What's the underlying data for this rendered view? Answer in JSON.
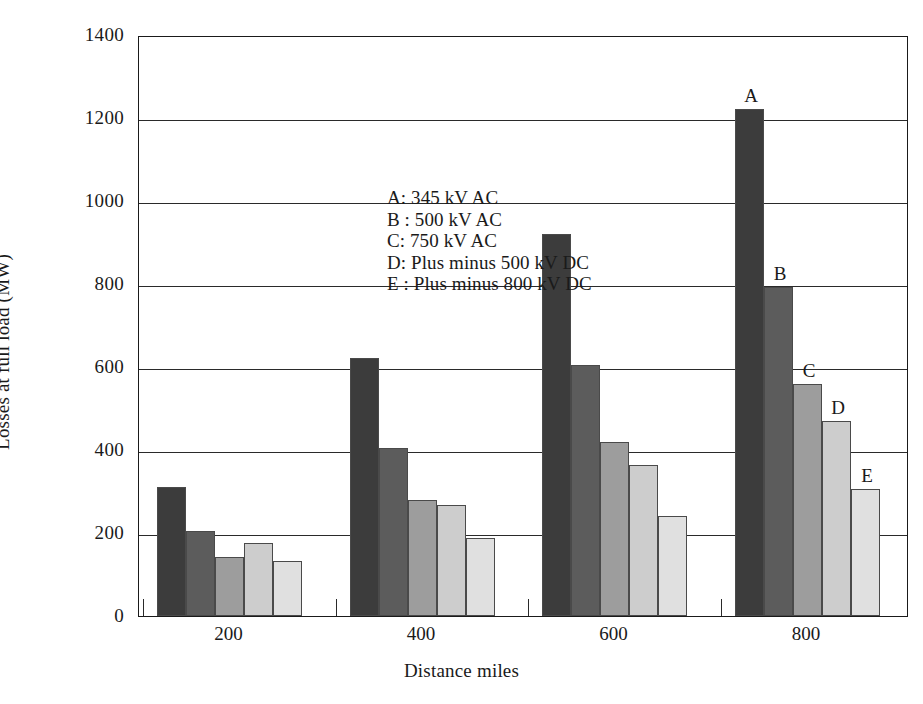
{
  "chart_data": {
    "type": "bar",
    "title": "",
    "xlabel": "Distance miles",
    "ylabel": "Losses at full load (MW)",
    "categories": [
      "200",
      "400",
      "600",
      "800"
    ],
    "ylim": [
      0,
      1400
    ],
    "yticks": [
      "0",
      "200",
      "400",
      "600",
      "800",
      "1000",
      "1200",
      "1400"
    ],
    "ytick_values": [
      0,
      200,
      400,
      600,
      800,
      1000,
      1200,
      1400
    ],
    "grid": "horizontal",
    "legend_position": "inside-upper-left",
    "series": [
      {
        "name": "A",
        "label": "A: 345 kV AC",
        "color": "#3c3c3c",
        "values": [
          310,
          622,
          920,
          1222
        ]
      },
      {
        "name": "B",
        "label": "B : 500 kV AC",
        "color": "#5c5c5c",
        "values": [
          205,
          404,
          605,
          792
        ]
      },
      {
        "name": "C",
        "label": "C: 750 kV AC",
        "color": "#9d9d9d",
        "values": [
          142,
          280,
          420,
          560
        ]
      },
      {
        "name": "D",
        "label": "D: Plus minus 500 kV DC",
        "color": "#cdcdcd",
        "values": [
          175,
          268,
          365,
          470
        ]
      },
      {
        "name": "E",
        "label": "E : Plus minus 800 kV DC",
        "color": "#e0e0e0",
        "values": [
          133,
          188,
          242,
          307
        ]
      }
    ],
    "point_labels": {
      "group_index": 3,
      "labels": [
        "A",
        "B",
        "C",
        "D",
        "E"
      ]
    },
    "axis_color": "#1a1a1a"
  },
  "legend": {
    "items": [
      "A: 345 kV AC",
      "B : 500 kV AC",
      "C: 750 kV AC",
      "D: Plus minus 500 kV DC",
      "E : Plus minus 800 kV DC"
    ]
  }
}
